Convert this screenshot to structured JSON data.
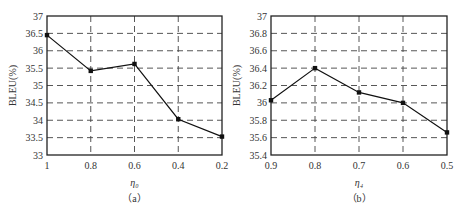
{
  "chart_data": [
    {
      "type": "line",
      "id": "a",
      "caption": "（a）",
      "xlabel": "η₀",
      "ylabel": "BLEU(%)",
      "x": [
        1,
        0.8,
        0.6,
        0.4,
        0.2
      ],
      "x_tick_labels": [
        "1",
        "0.8",
        "0.6",
        "0.4",
        "0.2"
      ],
      "ylim": [
        33,
        37
      ],
      "y_ticks": [
        33,
        33.5,
        34,
        34.5,
        35,
        35.5,
        36,
        36.5,
        37
      ],
      "y_tick_labels": [
        "33",
        "33.5",
        "34",
        "34.5",
        "35",
        "35.5",
        "36",
        "36.5",
        "37"
      ],
      "grid": true,
      "series": [
        {
          "name": "BLEU",
          "values": [
            36.45,
            35.42,
            35.62,
            34.03,
            33.53
          ]
        }
      ]
    },
    {
      "type": "line",
      "id": "b",
      "caption": "（b）",
      "xlabel": "η₄",
      "ylabel": "BLEU(%)",
      "x": [
        0.9,
        0.8,
        0.7,
        0.6,
        0.5
      ],
      "x_tick_labels": [
        "0.9",
        "0.8",
        "0.7",
        "0.6",
        "0.5"
      ],
      "ylim": [
        35.4,
        37
      ],
      "y_ticks": [
        35.4,
        35.6,
        35.8,
        36,
        36.2,
        36.4,
        36.6,
        36.8,
        37
      ],
      "y_tick_labels": [
        "35.4",
        "35.6",
        "35.8",
        "36",
        "36.2",
        "36.4",
        "36.6",
        "36.8",
        "37"
      ],
      "grid": true,
      "series": [
        {
          "name": "BLEU",
          "values": [
            36.03,
            36.4,
            36.12,
            36.0,
            35.66
          ]
        }
      ]
    }
  ]
}
